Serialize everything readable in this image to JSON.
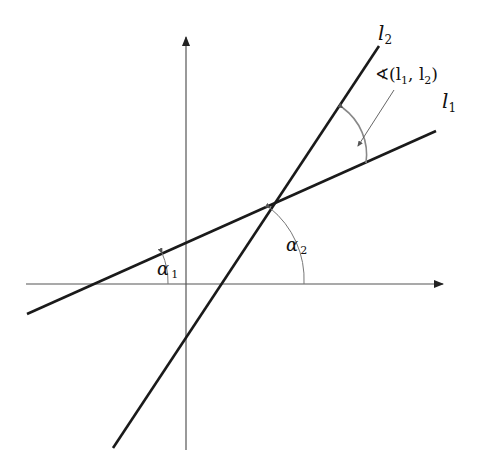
{
  "diagram": {
    "lines": [
      {
        "name": "l1",
        "label": "l",
        "subscript": "1",
        "from": [
          27,
          314
        ],
        "to": [
          436,
          131
        ]
      },
      {
        "name": "l2",
        "label": "l",
        "subscript": "2",
        "from": [
          113,
          448
        ],
        "to": [
          379,
          46
        ]
      }
    ],
    "axes": {
      "x": {
        "from": [
          26,
          284
        ],
        "to": [
          443,
          284
        ]
      },
      "y": {
        "from": [
          186,
          450
        ],
        "to": [
          186,
          37
        ]
      }
    },
    "angles": {
      "alpha1": {
        "label": "α",
        "subscript": "1"
      },
      "alpha2": {
        "label": "α",
        "subscript": "2"
      },
      "between": {
        "label": "∢(l",
        "sub1": "1",
        "comma": ", l",
        "sub2": "2",
        "close": ")"
      }
    },
    "colors": {
      "line": "#1a1a1a",
      "axis": "#555555",
      "arc": "#777777"
    }
  }
}
